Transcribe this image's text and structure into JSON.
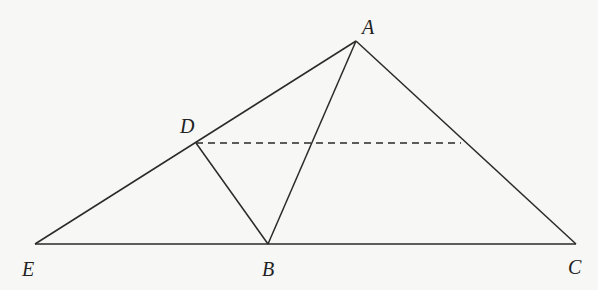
{
  "diagram": {
    "type": "geometry",
    "points": {
      "A": {
        "label": "A",
        "x": 356,
        "y": 41,
        "label_x": 362,
        "label_y": 34
      },
      "D": {
        "label": "D",
        "x": 196,
        "y": 143,
        "label_x": 180,
        "label_y": 133
      },
      "E": {
        "label": "E",
        "x": 35,
        "y": 244,
        "label_x": 22,
        "label_y": 276
      },
      "B": {
        "label": "B",
        "x": 268,
        "y": 244,
        "label_x": 262,
        "label_y": 276
      },
      "C": {
        "label": "C",
        "x": 576,
        "y": 244,
        "label_x": 568,
        "label_y": 274
      },
      "F": {
        "label": "",
        "x": 461,
        "y": 143
      }
    },
    "segments": [
      {
        "name": "segment-AE",
        "from": "A",
        "to": "E",
        "style": "solid"
      },
      {
        "name": "segment-AC",
        "from": "A",
        "to": "C",
        "style": "solid"
      },
      {
        "name": "segment-AB",
        "from": "A",
        "to": "B",
        "style": "solid"
      },
      {
        "name": "segment-EC",
        "from": "E",
        "to": "C",
        "style": "solid"
      },
      {
        "name": "segment-DB",
        "from": "D",
        "to": "B",
        "style": "solid"
      },
      {
        "name": "segment-DF",
        "from": "D",
        "to": "F",
        "style": "dashed"
      }
    ]
  }
}
